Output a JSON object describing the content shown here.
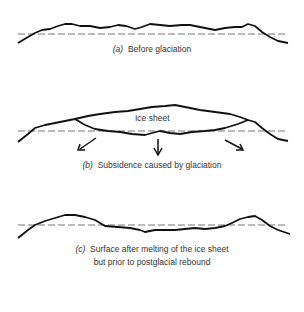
{
  "figure": {
    "panels": [
      {
        "id": "a",
        "letter": "(a)",
        "caption": "Before glaciation",
        "caption_lines": [
          "Before glaciation"
        ]
      },
      {
        "id": "b",
        "letter": "(b)",
        "caption": "Subsidence caused by glaciation",
        "caption_lines": [
          "Subsidence caused by glaciation"
        ],
        "ice_label": "Ice sheet",
        "arrows": [
          "down-left",
          "down",
          "down-right"
        ]
      },
      {
        "id": "c",
        "letter": "(c)",
        "caption": "Surface after melting of the ice sheet but prior to postglacial rebound",
        "caption_lines": [
          "Surface after melting of the ice sheet",
          "but prior to postglacial rebound"
        ]
      }
    ],
    "colors": {
      "line": "#111111",
      "dash": "#777777",
      "text": "#333333"
    }
  }
}
